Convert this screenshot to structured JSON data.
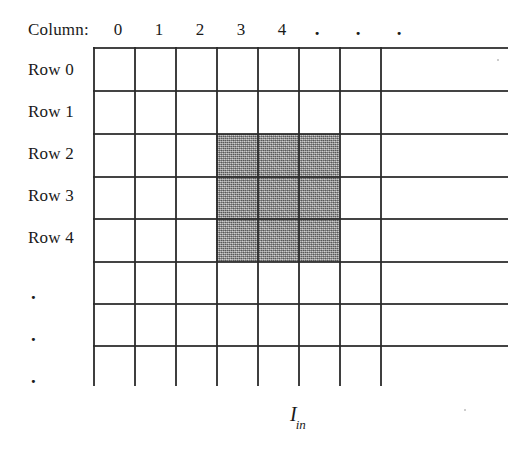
{
  "figure": {
    "caption_symbol": "I",
    "caption_subscript": "in",
    "column_header": {
      "label": "Column:",
      "ticks": [
        "0",
        "1",
        "2",
        "3",
        "4",
        ".",
        ".",
        "."
      ]
    },
    "row_header": {
      "labels": [
        "Row 0",
        "Row 1",
        "Row 2",
        "Row 3",
        "Row 4",
        ".",
        ".",
        "."
      ]
    },
    "grid": {
      "columns": 8,
      "rows": 8,
      "cell_width_px": 41,
      "cell_height_px": 42,
      "origin_x_px": 93,
      "origin_y_px": 48,
      "line_color": "#2a2a2a",
      "background_color": "#ffffff",
      "horizontal_extension_px": 508
    },
    "shaded_region": {
      "description": "3x3 neighbourhood",
      "start_column": 3,
      "end_column": 5,
      "start_row": 2,
      "end_row": 4,
      "fill_color": "#9a9a9a"
    }
  }
}
